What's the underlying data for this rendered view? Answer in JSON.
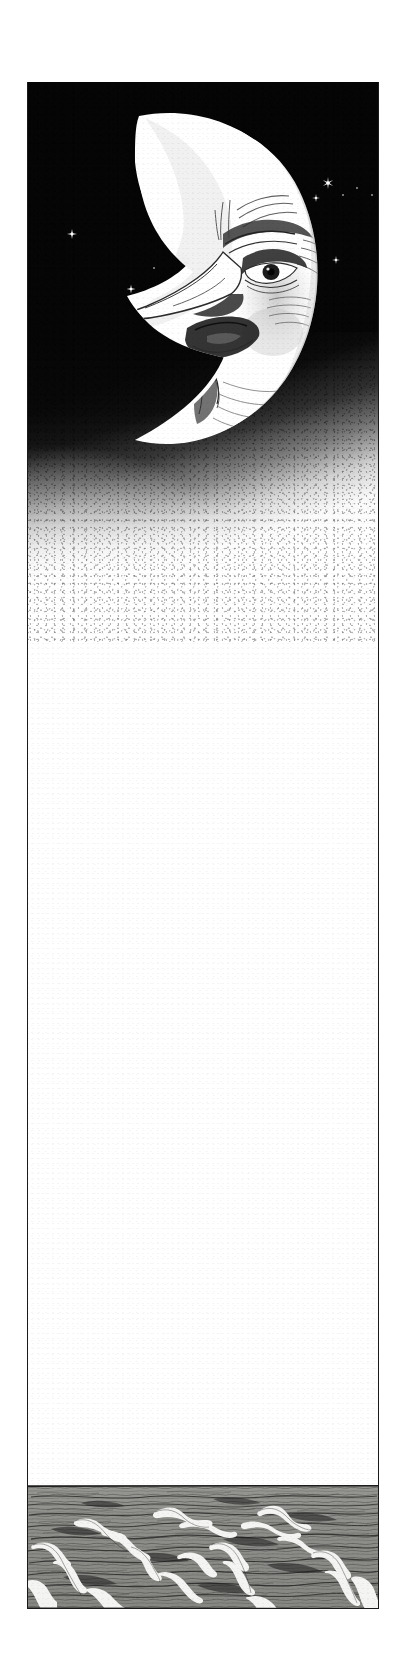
{
  "artwork": {
    "title": "Crescent Moon Over the Sea",
    "medium": "pen-and-ink illustration",
    "orientation": "tall vertical panel",
    "alt_text": "A scowling man-in-the-moon crescent in a black star-filled sky above a wide blank expanse that fades to a choppy grey sea at the bottom."
  },
  "canvas": {
    "width": 412,
    "height": 1672,
    "background_color": "#ffffff"
  },
  "panel": {
    "name": "framed-illustration-panel",
    "left": 27,
    "top": 82,
    "width": 352,
    "height": 1527,
    "border_color": "#1a1a1a",
    "border_width": 1.4,
    "fill_color": "#ffffff"
  },
  "sky": {
    "name": "night-sky",
    "height": 560,
    "color": "#050505",
    "fade_direction": "diagonal from upper-right black to lower-left white",
    "texture": "stippled ink spatter"
  },
  "moon": {
    "name": "crescent-moon-with-face",
    "fill_color": "#ffffff",
    "ink_color": "#2a2a2a",
    "expression": "scowling / grumpy",
    "features": [
      "hooked-nose",
      "furrowed-brow",
      "single-visible-eye",
      "open-mouth",
      "pointed-chin",
      "cheek-hatching"
    ],
    "center_x": 198,
    "center_y": 250,
    "radius": 128
  },
  "stars": {
    "name": "star-field",
    "color": "#ffffff",
    "count": 22,
    "items": [
      {
        "x": 45,
        "y": 152,
        "size": 10,
        "kind": "four-point"
      },
      {
        "x": 104,
        "y": 207,
        "size": 9,
        "kind": "four-point"
      },
      {
        "x": 143,
        "y": 203,
        "size": 12,
        "kind": "six-point"
      },
      {
        "x": 127,
        "y": 186,
        "size": 3,
        "kind": "dot"
      },
      {
        "x": 289,
        "y": 116,
        "size": 8,
        "kind": "four-point"
      },
      {
        "x": 301,
        "y": 101,
        "size": 12,
        "kind": "six-point"
      },
      {
        "x": 316,
        "y": 113,
        "size": 3,
        "kind": "dot"
      },
      {
        "x": 330,
        "y": 106,
        "size": 3,
        "kind": "dot"
      },
      {
        "x": 345,
        "y": 113,
        "size": 3,
        "kind": "dot"
      },
      {
        "x": 360,
        "y": 105,
        "size": 3,
        "kind": "dot"
      },
      {
        "x": 309,
        "y": 178,
        "size": 8,
        "kind": "four-point"
      },
      {
        "x": 365,
        "y": 131,
        "size": 3,
        "kind": "dot"
      },
      {
        "x": 366,
        "y": 418,
        "size": 10,
        "kind": "six-point"
      },
      {
        "x": 335,
        "y": 438,
        "size": 8,
        "kind": "five-point"
      },
      {
        "x": 300,
        "y": 432,
        "size": 7,
        "kind": "five-point"
      },
      {
        "x": 353,
        "y": 453,
        "size": 9,
        "kind": "six-point"
      },
      {
        "x": 352,
        "y": 488,
        "size": 10,
        "kind": "six-point"
      },
      {
        "x": 331,
        "y": 516,
        "size": 8,
        "kind": "six-point"
      },
      {
        "x": 357,
        "y": 523,
        "size": 9,
        "kind": "six-point"
      },
      {
        "x": 339,
        "y": 462,
        "size": 3,
        "kind": "dot"
      },
      {
        "x": 323,
        "y": 477,
        "size": 3,
        "kind": "dot"
      },
      {
        "x": 348,
        "y": 540,
        "size": 3,
        "kind": "dot"
      }
    ]
  },
  "blank_expanse": {
    "name": "blank-white-expanse",
    "top": 560,
    "bottom": 1403,
    "color": "#ffffff",
    "note": "empty page area between sky and sea"
  },
  "sea": {
    "name": "stormy-sea",
    "horizon_y": 1403,
    "height": 124,
    "water_color": "#8d8d89",
    "foam_color": "#f2f2f0",
    "ink_color": "#1f1f1f",
    "description": "choppy water with breaking whitecaps, drawn in fine horizontal pen hatching"
  }
}
